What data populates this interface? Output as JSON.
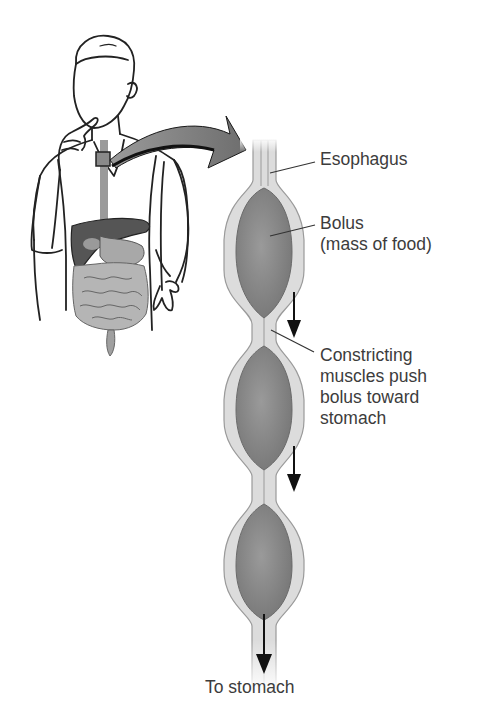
{
  "diagram": {
    "colors": {
      "outline": "#1e1e1e",
      "esophagus_wall": "#d9d9d9",
      "esophagus_lumen": "#c4c4c4",
      "bolus": "#8a8a8a",
      "liver": "#555555",
      "intestines": "#b0b0b0",
      "arrow": "#111111",
      "curved_arrow": "#7a7a7a",
      "text": "#3c3c3c"
    },
    "labels": {
      "esophagus": "Esophagus",
      "bolus_line1": "Bolus",
      "bolus_line2": "(mass of food)",
      "constricting_line1": "Constricting",
      "constricting_line2": "muscles push",
      "constricting_line3": "bolus toward",
      "constricting_line4": "stomach",
      "to_stomach": "To stomach"
    },
    "boluses": 3,
    "direction_arrows": 3
  }
}
